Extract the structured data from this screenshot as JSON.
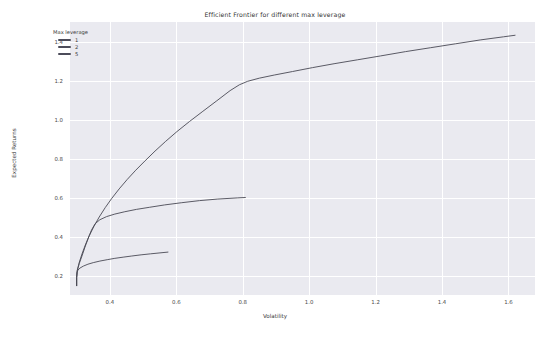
{
  "chart_data": {
    "type": "line",
    "title": "Efficient Frontier for different max leverage",
    "xlabel": "Volatility",
    "ylabel": "Expected Returns",
    "xlim": [
      0.28,
      1.68
    ],
    "ylim": [
      0.1,
      1.5
    ],
    "xticks": [
      "0.4",
      "0.6",
      "0.8",
      "1.0",
      "1.2",
      "1.4",
      "1.6"
    ],
    "xtick_values": [
      0.4,
      0.6,
      0.8,
      1.0,
      1.2,
      1.4,
      1.6
    ],
    "yticks": [
      "0.2",
      "0.4",
      "0.6",
      "0.8",
      "1.0",
      "1.2",
      "1.4"
    ],
    "ytick_values": [
      0.2,
      0.4,
      0.6,
      0.8,
      1.0,
      1.2,
      1.4
    ],
    "grid": true,
    "grid_color": "#ffffff",
    "plot_background": "#eaeaf0",
    "legend": {
      "title": "Max leverage",
      "position": "upper-left",
      "entries": [
        {
          "label": "1",
          "color": "#4c4c5a"
        },
        {
          "label": "2",
          "color": "#4c4c5a"
        },
        {
          "label": "5",
          "color": "#4c4c5a"
        }
      ]
    },
    "series": [
      {
        "name": "1",
        "color": "#4a4a55",
        "points": [
          [
            0.3,
            0.148
          ],
          [
            0.3,
            0.19
          ],
          [
            0.301,
            0.215
          ],
          [
            0.304,
            0.228
          ],
          [
            0.31,
            0.238
          ],
          [
            0.32,
            0.248
          ],
          [
            0.334,
            0.258
          ],
          [
            0.35,
            0.266
          ],
          [
            0.37,
            0.274
          ],
          [
            0.392,
            0.281
          ],
          [
            0.415,
            0.288
          ],
          [
            0.44,
            0.294
          ],
          [
            0.466,
            0.3
          ],
          [
            0.494,
            0.306
          ],
          [
            0.522,
            0.311
          ],
          [
            0.551,
            0.316
          ],
          [
            0.575,
            0.32
          ]
        ]
      },
      {
        "name": "2",
        "color": "#4a4a55",
        "points": [
          [
            0.3,
            0.148
          ],
          [
            0.3,
            0.19
          ],
          [
            0.302,
            0.225
          ],
          [
            0.308,
            0.262
          ],
          [
            0.316,
            0.3
          ],
          [
            0.325,
            0.345
          ],
          [
            0.335,
            0.392
          ],
          [
            0.345,
            0.434
          ],
          [
            0.356,
            0.466
          ],
          [
            0.37,
            0.486
          ],
          [
            0.39,
            0.502
          ],
          [
            0.415,
            0.515
          ],
          [
            0.445,
            0.527
          ],
          [
            0.48,
            0.539
          ],
          [
            0.52,
            0.55
          ],
          [
            0.565,
            0.562
          ],
          [
            0.615,
            0.573
          ],
          [
            0.67,
            0.584
          ],
          [
            0.725,
            0.592
          ],
          [
            0.785,
            0.598
          ],
          [
            0.808,
            0.6
          ]
        ]
      },
      {
        "name": "5",
        "color": "#4a4a55",
        "points": [
          [
            0.3,
            0.148
          ],
          [
            0.3,
            0.19
          ],
          [
            0.302,
            0.228
          ],
          [
            0.308,
            0.268
          ],
          [
            0.316,
            0.31
          ],
          [
            0.326,
            0.356
          ],
          [
            0.338,
            0.404
          ],
          [
            0.352,
            0.452
          ],
          [
            0.368,
            0.5
          ],
          [
            0.386,
            0.548
          ],
          [
            0.406,
            0.596
          ],
          [
            0.428,
            0.644
          ],
          [
            0.452,
            0.692
          ],
          [
            0.478,
            0.74
          ],
          [
            0.506,
            0.788
          ],
          [
            0.536,
            0.838
          ],
          [
            0.568,
            0.888
          ],
          [
            0.602,
            0.938
          ],
          [
            0.64,
            0.99
          ],
          [
            0.68,
            1.042
          ],
          [
            0.722,
            1.096
          ],
          [
            0.762,
            1.148
          ],
          [
            0.79,
            1.178
          ],
          [
            0.815,
            1.196
          ],
          [
            0.85,
            1.212
          ],
          [
            0.895,
            1.228
          ],
          [
            0.95,
            1.246
          ],
          [
            1.01,
            1.266
          ],
          [
            1.075,
            1.286
          ],
          [
            1.145,
            1.306
          ],
          [
            1.215,
            1.326
          ],
          [
            1.29,
            1.348
          ],
          [
            1.365,
            1.368
          ],
          [
            1.44,
            1.388
          ],
          [
            1.515,
            1.408
          ],
          [
            1.585,
            1.424
          ],
          [
            1.62,
            1.432
          ]
        ]
      }
    ]
  }
}
